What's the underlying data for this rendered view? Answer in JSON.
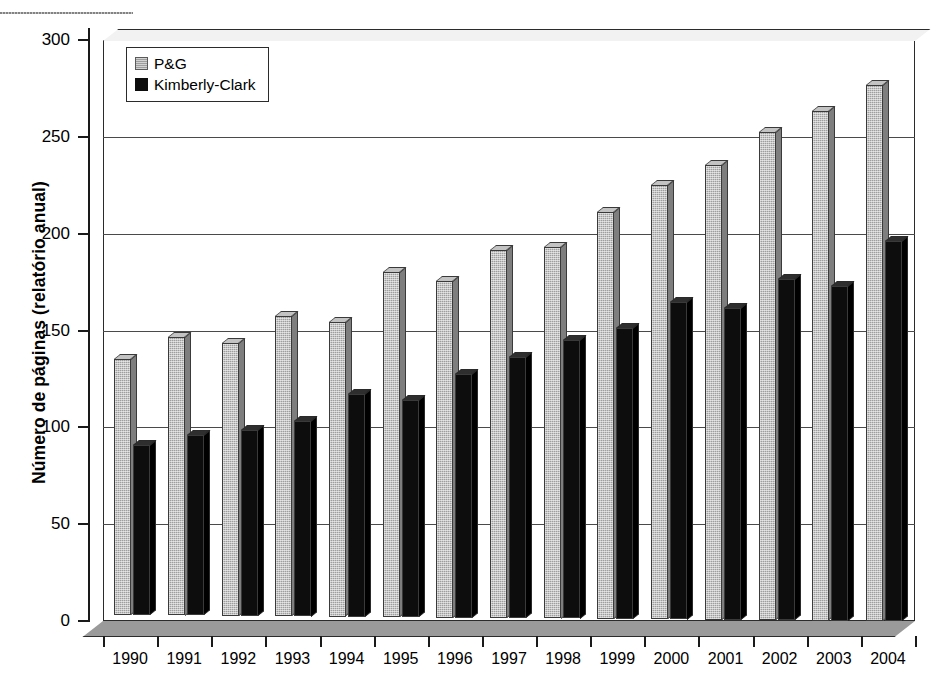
{
  "chart_data": {
    "type": "bar",
    "title": "",
    "xlabel": "",
    "ylabel": "Número de páginas (relatório anual)",
    "categories": [
      "1990",
      "1991",
      "1992",
      "1993",
      "1994",
      "1995",
      "1996",
      "1997",
      "1998",
      "1999",
      "2000",
      "2001",
      "2002",
      "2003",
      "2004"
    ],
    "series": [
      {
        "name": "P&G",
        "color": "#9d9d9d",
        "values": [
          132,
          144,
          141,
          155,
          152,
          178,
          174,
          190,
          192,
          210,
          224,
          235,
          252,
          263,
          277
        ]
      },
      {
        "name": "Kimberly-Clark",
        "color": "#0d0d0d",
        "values": [
          88,
          93,
          96,
          101,
          115,
          112,
          126,
          135,
          144,
          150,
          164,
          161,
          176,
          173,
          196
        ]
      }
    ],
    "ylim": [
      0,
      300
    ],
    "yticks": [
      0,
      50,
      100,
      150,
      200,
      250,
      300
    ],
    "ytick_labels": [
      "0",
      "50",
      "100",
      "150",
      "200",
      "250",
      "300"
    ],
    "grid": true,
    "legend_position": "top-left",
    "style": "3d-column"
  },
  "legend": {
    "items": [
      {
        "label": "P&G",
        "swatch": "pg"
      },
      {
        "label": "Kimberly-Clark",
        "swatch": "kc"
      }
    ]
  }
}
